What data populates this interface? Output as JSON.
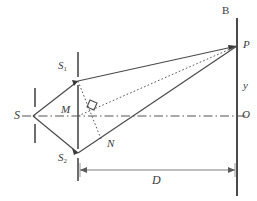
{
  "figure": {
    "type": "optics-ray-diagram",
    "background": "#ffffff",
    "stroke_color": "#4a4a4a",
    "dash_dot_color": "#555555",
    "label_color": "#3a3a3a",
    "width": 257,
    "height": 201
  },
  "labels": {
    "source_slit": "S",
    "slit_upper": "S",
    "slit_upper_sub": "1",
    "slit_lower": "S",
    "slit_lower_sub": "2",
    "midpoint": "M",
    "foot_of_perpendicular": "N",
    "screen": "B",
    "point_on_screen": "P",
    "fringe_position": "y",
    "center_of_screen": "O",
    "slit_to_screen_distance": "D"
  },
  "geometry": {
    "source_point": [
      33,
      116
    ],
    "slit_upper_point": [
      78,
      81
    ],
    "slit_lower_point": [
      78,
      153
    ],
    "midpoint_point": [
      78,
      116
    ],
    "foot_point": [
      101,
      139
    ],
    "screen_point_p": [
      237,
      46
    ],
    "screen_center_o": [
      237,
      116
    ],
    "axis_y": 116,
    "screen_x": 237,
    "slit_plane_x": 78,
    "source_plane_x": 35
  },
  "annotations": {
    "right_angle_at": [
      96,
      109
    ],
    "d_arrow_y": 170,
    "d_arrow_from_x": 80,
    "d_arrow_to_x": 235
  }
}
